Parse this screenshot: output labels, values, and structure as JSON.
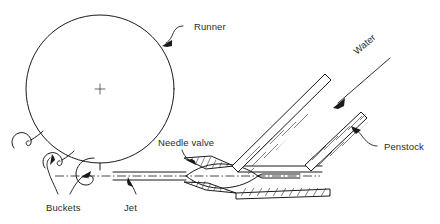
{
  "diagram": {
    "background_color": "#ffffff",
    "line_color": "#1a1a1a",
    "text_color": "#2b2b2b",
    "labels": {
      "runner": "Runner",
      "needle_valve": "Needle valve",
      "water": "Water",
      "penstock": "Penstock",
      "buckets": "Buckets",
      "jet": "Jet"
    },
    "parts": [
      {
        "name": "runner",
        "label": "Runner",
        "shape": "circle",
        "center": [
          100,
          89
        ],
        "radius": 74
      },
      {
        "name": "center-mark",
        "label": "",
        "shape": "cross",
        "center": [
          100,
          89
        ],
        "size": 9
      },
      {
        "name": "buckets",
        "label": "Buckets",
        "shape": "bucket-hooks",
        "count": 3
      },
      {
        "name": "jet",
        "label": "Jet",
        "shape": "parallel-lines"
      },
      {
        "name": "needle-valve",
        "label": "Needle valve",
        "shape": "needle"
      },
      {
        "name": "penstock",
        "label": "Penstock",
        "shape": "hatched-pipe"
      },
      {
        "name": "water-flow-arrow",
        "label": "Water",
        "shape": "arrow",
        "direction": "down-left"
      }
    ]
  }
}
